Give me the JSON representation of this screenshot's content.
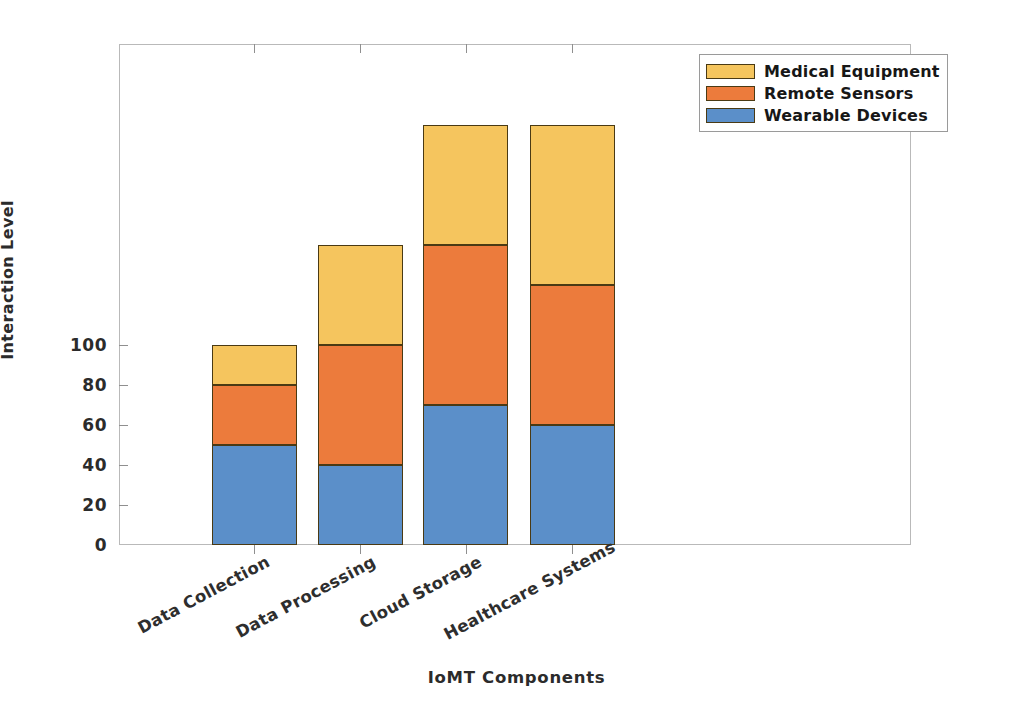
{
  "chart_data": {
    "type": "bar",
    "subtype": "stacked-vertical",
    "title": "",
    "xlabel": "IoMT Components",
    "ylabel": "Interaction Level",
    "categories": [
      "Data Collection",
      "Data Processing",
      "Cloud Storage",
      "Healthcare Systems"
    ],
    "series": [
      {
        "name": "Wearable Devices",
        "color": "#5B8FC9",
        "values": [
          50,
          40,
          70,
          60
        ]
      },
      {
        "name": "Remote Sensors",
        "color": "#EC7B3C",
        "values": [
          30,
          60,
          80,
          70
        ]
      },
      {
        "name": "Medical Equipment",
        "color": "#F5C55E",
        "values": [
          20,
          50,
          60,
          80
        ]
      }
    ],
    "stack_totals": [
      100,
      150,
      210,
      210
    ],
    "ylim": [
      0,
      226
    ],
    "yticks": [
      0,
      20,
      40,
      60,
      80,
      100
    ],
    "ytick_labels": [
      "0",
      "20",
      "40",
      "60",
      "80",
      "100"
    ],
    "grid": false,
    "legend_position": "top-right",
    "legend_order": [
      "Medical Equipment",
      "Remote Sensors",
      "Wearable Devices"
    ],
    "xtick_label_rotation": -28,
    "axis_color": "#b9b9b9",
    "bar_edge_color": "#4a3a14",
    "background": "#ffffff"
  },
  "legend": {
    "items": [
      {
        "label": "Medical Equipment",
        "color": "#F5C55E"
      },
      {
        "label": "Remote Sensors",
        "color": "#EC7B3C"
      },
      {
        "label": "Wearable Devices",
        "color": "#5B8FC9"
      }
    ]
  }
}
